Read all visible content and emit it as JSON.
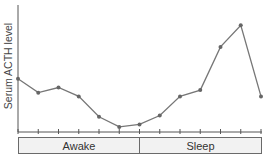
{
  "chart_data": {
    "type": "line",
    "title": "",
    "xlabel": "",
    "ylabel": "Serum ACTH level",
    "x": [
      0,
      1,
      2,
      3,
      4,
      5,
      6,
      7,
      8,
      9,
      10,
      11,
      12
    ],
    "values": [
      42,
      31,
      35,
      28,
      12,
      4,
      6,
      13,
      28,
      33,
      67,
      84,
      28
    ],
    "ylim": [
      0,
      100
    ],
    "grid": false,
    "legend": null,
    "tick_count": 13,
    "phases": [
      {
        "label": "Awake",
        "from_index": 0,
        "to_index": 6
      },
      {
        "label": "Sleep",
        "from_index": 6,
        "to_index": 12
      }
    ],
    "colors": {
      "line": "#777777",
      "marker": "#666666",
      "axis": "#555555"
    }
  }
}
